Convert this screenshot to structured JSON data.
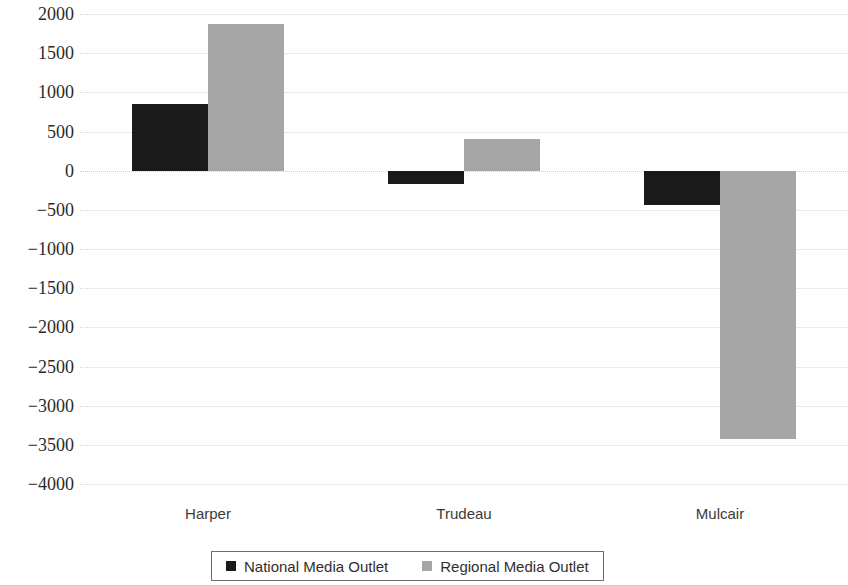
{
  "chart_data": {
    "type": "bar",
    "title": "",
    "subtitle": "",
    "xlabel": "",
    "ylabel": "",
    "categories": [
      "Harper",
      "Trudeau",
      "Mulcair"
    ],
    "series": [
      {
        "name": "National Media Outlet",
        "color": "#1a1a1a",
        "values": [
          850,
          -170,
          -440
        ]
      },
      {
        "name": "Regional Media Outlet",
        "color": "#a6a6a6",
        "values": [
          1870,
          410,
          -3430
        ]
      }
    ],
    "ylim": [
      -4000,
      2000
    ],
    "ytick_step": 500,
    "ytick_labels": [
      "2000",
      "1500",
      "1000",
      "500",
      "0",
      "−500",
      "−1000",
      "−1500",
      "−2000",
      "−2500",
      "−3000",
      "−3500",
      "−4000"
    ],
    "ytick_values": [
      2000,
      1500,
      1000,
      500,
      0,
      -500,
      -1000,
      -1500,
      -2000,
      -2500,
      -3000,
      -3500,
      -4000
    ],
    "grid": true,
    "grid_axis": "y",
    "legend_position": "bottom",
    "legend_entries": [
      "National Media Outlet",
      "Regional Media Outlet"
    ],
    "zero_baseline": 0
  }
}
